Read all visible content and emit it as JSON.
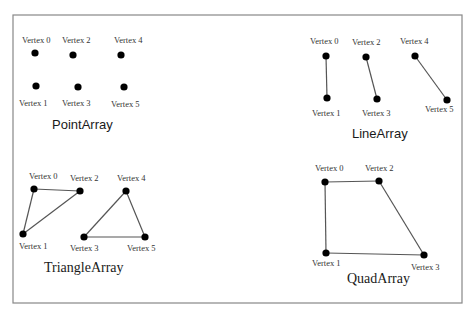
{
  "frame": {
    "x": 13,
    "y": 15,
    "width": 449,
    "height": 288,
    "stroke": "#888888"
  },
  "colors": {
    "vertex": "#000000",
    "edge": "#555555",
    "label": "#333333",
    "title": "#1a1a1a"
  },
  "panels": [
    {
      "id": "point-array",
      "title": "PointArray",
      "title_font": "sans",
      "title_pos": [
        52,
        129
      ],
      "vertices": [
        {
          "label": "Vertex 0",
          "x": 35,
          "y": 53,
          "lx": 22,
          "ly": 43
        },
        {
          "label": "Vertex 1",
          "x": 36,
          "y": 86,
          "lx": 19,
          "ly": 106
        },
        {
          "label": "Vertex 2",
          "x": 73,
          "y": 55,
          "lx": 62,
          "ly": 43
        },
        {
          "label": "Vertex 3",
          "x": 78,
          "y": 87,
          "lx": 62,
          "ly": 106
        },
        {
          "label": "Vertex 4",
          "x": 121,
          "y": 55,
          "lx": 114,
          "ly": 43
        },
        {
          "label": "Vertex 5",
          "x": 124,
          "y": 87,
          "lx": 111,
          "ly": 107
        }
      ],
      "edges": []
    },
    {
      "id": "line-array",
      "title": "LineArray",
      "title_font": "sans",
      "title_pos": [
        352,
        138
      ],
      "vertices": [
        {
          "label": "Vertex 0",
          "x": 326,
          "y": 56,
          "lx": 310,
          "ly": 44
        },
        {
          "label": "Vertex 1",
          "x": 327,
          "y": 98,
          "lx": 312,
          "ly": 116
        },
        {
          "label": "Vertex 2",
          "x": 366,
          "y": 57,
          "lx": 352,
          "ly": 45
        },
        {
          "label": "Vertex 3",
          "x": 377,
          "y": 99,
          "lx": 362,
          "ly": 116
        },
        {
          "label": "Vertex 4",
          "x": 415,
          "y": 56,
          "lx": 400,
          "ly": 44
        },
        {
          "label": "Vertex 5",
          "x": 447,
          "y": 100,
          "lx": 425,
          "ly": 112
        }
      ],
      "edges": [
        [
          0,
          1
        ],
        [
          2,
          3
        ],
        [
          4,
          5
        ]
      ]
    },
    {
      "id": "triangle-array",
      "title": "TriangleArray",
      "title_font": "serif",
      "title_pos": [
        44,
        272
      ],
      "vertices": [
        {
          "label": "Vertex 0",
          "x": 34,
          "y": 189,
          "lx": 29,
          "ly": 179
        },
        {
          "label": "Vertex 1",
          "x": 23,
          "y": 234,
          "lx": 19,
          "ly": 249
        },
        {
          "label": "Vertex 2",
          "x": 80,
          "y": 191,
          "lx": 70,
          "ly": 181
        },
        {
          "label": "Vertex 3",
          "x": 84,
          "y": 237,
          "lx": 70,
          "ly": 251
        },
        {
          "label": "Vertex 4",
          "x": 126,
          "y": 191,
          "lx": 117,
          "ly": 181
        },
        {
          "label": "Vertex 5",
          "x": 145,
          "y": 237,
          "lx": 127,
          "ly": 251
        }
      ],
      "edges": [
        [
          0,
          1
        ],
        [
          1,
          2
        ],
        [
          2,
          0
        ],
        [
          3,
          4
        ],
        [
          4,
          5
        ],
        [
          5,
          3
        ]
      ]
    },
    {
      "id": "quad-array",
      "title": "QuadArray",
      "title_font": "serif",
      "title_pos": [
        347,
        283
      ],
      "vertices": [
        {
          "label": "Vertex 0",
          "x": 325,
          "y": 182,
          "lx": 315,
          "ly": 171
        },
        {
          "label": "Vertex 1",
          "x": 326,
          "y": 253,
          "lx": 312,
          "ly": 266
        },
        {
          "label": "Vertex 2",
          "x": 379,
          "y": 181,
          "lx": 365,
          "ly": 171
        },
        {
          "label": "Vertex 3",
          "x": 424,
          "y": 255,
          "lx": 411,
          "ly": 270
        }
      ],
      "edges": [
        [
          0,
          1
        ],
        [
          1,
          3
        ],
        [
          3,
          2
        ],
        [
          2,
          0
        ]
      ]
    }
  ]
}
